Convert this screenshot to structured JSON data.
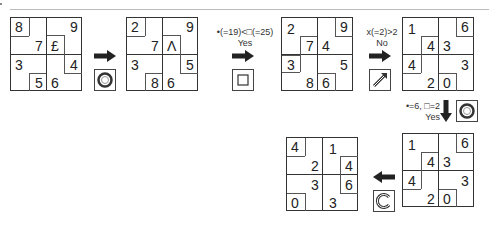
{
  "grids": [
    {
      "id": "g1",
      "cells": [
        "8",
        "9",
        "7",
        "£",
        "3",
        "4",
        "5",
        "6"
      ]
    },
    {
      "id": "g2",
      "cells": [
        "2",
        "9",
        "7",
        "Λ",
        "3",
        "5",
        "8",
        "6"
      ]
    },
    {
      "id": "g3",
      "cells": [
        "2",
        "9",
        "7",
        "4",
        "3",
        "5",
        "8",
        "6"
      ]
    },
    {
      "id": "g4",
      "cells": [
        "1",
        "6",
        "4",
        "3",
        "4",
        "3",
        "2",
        "0"
      ]
    },
    {
      "id": "g5",
      "cells": [
        "1",
        "6",
        "4",
        "3",
        "4",
        "3",
        "2",
        "0"
      ]
    },
    {
      "id": "g6",
      "cells": [
        "4",
        "1",
        "2",
        "4",
        "3",
        "6",
        "0",
        "3"
      ]
    }
  ],
  "steps": [
    {
      "icon": "rotate-circle-icon"
    },
    {
      "condition": "•(=19)<□(=25)",
      "answer": "Yes",
      "icon": "square-icon"
    },
    {
      "condition": "x(=2)>2",
      "answer": "No",
      "icon": "diagonal-arrow-icon"
    },
    {
      "condition": "•=6, □=2",
      "answer": "Yes",
      "icon": "rotate-circle-icon"
    },
    {
      "icon": "rotate-c-icon"
    }
  ]
}
